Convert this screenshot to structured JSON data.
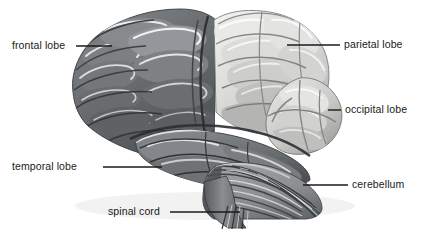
{
  "figure": {
    "background_color": "#ffffff",
    "label_text_color": "#1a1a1a",
    "leader_line_color": "#1a1a1a"
  },
  "labels": {
    "frontal_lobe": "frontal lobe",
    "parietal_lobe": "parietal lobe",
    "occipital_lobe": "occipital lobe",
    "temporal_lobe": "temporal lobe",
    "cerebellum": "cerebellum",
    "spinal_cord": "spinal cord"
  },
  "regions": [
    {
      "name": "frontal-lobe",
      "label": "frontal lobe",
      "fill": "#6e7174",
      "shade": "#4d5053",
      "highlight": "#9fa3a6",
      "label_side": "left",
      "label_x": 12,
      "label_y": 40,
      "leader_from_x": 76,
      "leader_from_y": 46,
      "leader_to_x": 112,
      "leader_to_y": 46
    },
    {
      "name": "parietal-lobe",
      "label": "parietal lobe",
      "fill": "#d8d9d6",
      "shade": "#a9aaa7",
      "highlight": "#f2f2f0",
      "label_side": "right",
      "label_x": 344,
      "label_y": 39,
      "leader_from_x": 287,
      "leader_from_y": 45,
      "leader_to_x": 340,
      "leader_to_y": 45
    },
    {
      "name": "occipital-lobe",
      "label": "occipital lobe",
      "fill": "#cfd0cd",
      "shade": "#9b9c99",
      "highlight": "#eeeeec",
      "label_side": "right",
      "label_x": 344,
      "label_y": 104,
      "leader_from_x": 330,
      "leader_from_y": 110,
      "leader_to_x": 340,
      "leader_to_y": 110
    },
    {
      "name": "temporal-lobe",
      "label": "temporal lobe",
      "fill": "#75787b",
      "shade": "#53565a",
      "highlight": "#a6aaad",
      "label_side": "left",
      "label_x": 12,
      "label_y": 161,
      "leader_from_x": 103,
      "leader_from_y": 167,
      "leader_to_x": 162,
      "leader_to_y": 167
    },
    {
      "name": "cerebellum",
      "label": "cerebellum",
      "fill": "#8d9093",
      "shade": "#5e6164",
      "highlight": "#c5c8ca",
      "label_side": "right",
      "label_x": 352,
      "label_y": 179,
      "leader_from_x": 303,
      "leader_from_y": 185,
      "leader_to_x": 348,
      "leader_to_y": 185
    },
    {
      "name": "spinal-cord",
      "label": "spinal cord",
      "fill": "#7d8083",
      "shade": "#55585b",
      "highlight": "#b0b3b6",
      "label_side": "left",
      "label_x": 108,
      "label_y": 206,
      "leader_from_x": 170,
      "leader_from_y": 212,
      "leader_to_x": 240,
      "leader_to_y": 212
    }
  ],
  "palette": {
    "frontal_gray": "#6e7174",
    "parietal_light": "#d8d9d6",
    "occipital_light": "#cfd0cd",
    "temporal_gray": "#75787b",
    "cerebellum_gray": "#8d9093",
    "outline_dark": "#2f3234",
    "sulcus_dark": "#3c3f42",
    "gyrus_highlight": "#e8e9e6",
    "background": "#ffffff"
  }
}
